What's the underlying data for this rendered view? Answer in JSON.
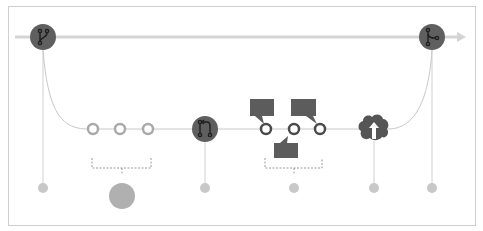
{
  "diagram": {
    "colors": {
      "frame": "#cfcfcf",
      "main_line": "#d4d4d4",
      "branch_line": "#c8c8c8",
      "node_dark": "#5f5f5f",
      "node_glyph": "#1e1e1e",
      "commit_ring": "#6a6a6a",
      "commit_ring_light": "#a9a9a9",
      "drop_dot": "#c8c8c8",
      "big_dot": "#b0b0b0",
      "bracket": "#9a9a9a",
      "bubble": "#5c5c5c",
      "cloud": "#555555",
      "arrow_up": "#ffffff"
    },
    "main_branch": {
      "label": "main",
      "start_node": {
        "icon": "git-branch-icon",
        "x": 43,
        "y": 37
      },
      "end_node": {
        "icon": "git-merge-icon",
        "x": 432,
        "y": 37
      }
    },
    "feature_branch": {
      "commits": [
        {
          "icon": "commit-ring-icon",
          "x": 93,
          "y": 129,
          "style": "light"
        },
        {
          "icon": "commit-ring-icon",
          "x": 120,
          "y": 129,
          "style": "light"
        },
        {
          "icon": "commit-ring-icon",
          "x": 148,
          "y": 129,
          "style": "light"
        }
      ],
      "pull_request_node": {
        "icon": "git-pull-request-icon",
        "x": 205,
        "y": 129
      },
      "review_commits": [
        {
          "icon": "commit-ring-icon",
          "x": 266,
          "y": 129,
          "style": "dark"
        },
        {
          "icon": "commit-ring-icon",
          "x": 294,
          "y": 129,
          "style": "dark"
        },
        {
          "icon": "commit-ring-icon",
          "x": 320,
          "y": 129,
          "style": "dark"
        }
      ],
      "comments": [
        {
          "icon": "comment-bubble-icon",
          "x": 250,
          "y": 99,
          "tail": "bottom-left"
        },
        {
          "icon": "comment-bubble-icon",
          "x": 290,
          "y": 99,
          "tail": "bottom-right"
        },
        {
          "icon": "comment-bubble-icon",
          "x": 274,
          "y": 143,
          "tail": "top-left"
        }
      ],
      "deploy_node": {
        "icon": "cloud-upload-icon",
        "x": 374,
        "y": 129
      }
    },
    "steps": [
      {
        "name": "create-branch",
        "x": 43,
        "y": 188,
        "size": "small"
      },
      {
        "name": "add-commits",
        "x": 122,
        "y": 197,
        "size": "large"
      },
      {
        "name": "open-pull-request",
        "x": 205,
        "y": 188,
        "size": "small"
      },
      {
        "name": "discuss-review",
        "x": 294,
        "y": 188,
        "size": "small"
      },
      {
        "name": "deploy",
        "x": 374,
        "y": 188,
        "size": "small"
      },
      {
        "name": "merge",
        "x": 432,
        "y": 188,
        "size": "small"
      }
    ]
  }
}
